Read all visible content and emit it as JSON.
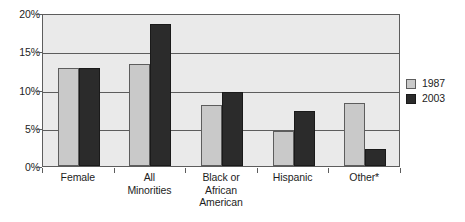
{
  "chart_data": {
    "type": "bar",
    "title": "",
    "subtitle": "",
    "xlabel": "",
    "ylabel": "",
    "categories": [
      "Female",
      "All Minorities",
      "Black or African American",
      "Hispanic",
      "Other*"
    ],
    "category_label_lines": [
      [
        "Female"
      ],
      [
        "All",
        "Minorities"
      ],
      [
        "Black or",
        "African",
        "American"
      ],
      [
        "Hispanic"
      ],
      [
        "Other*"
      ]
    ],
    "series": [
      {
        "name": "1987",
        "color": "#c9c9c9",
        "values": [
          12.8,
          13.3,
          8.0,
          4.6,
          8.3
        ]
      },
      {
        "name": "2003",
        "color": "#2b2b2b",
        "values": [
          12.8,
          18.5,
          9.7,
          7.2,
          2.2
        ]
      }
    ],
    "ylim": [
      0,
      20
    ],
    "ytick_values": [
      0,
      5,
      10,
      15,
      20
    ],
    "ytick_labels": [
      "0%",
      "5%",
      "10%",
      "15%",
      "20%"
    ],
    "grid": true,
    "grid_axis": "y",
    "legend_position": "right",
    "legend_entries": [
      "1987",
      "2003"
    ],
    "frame_background": "#eaeaea",
    "frame_border_color": "#5d5d5d",
    "page_background": "#ffffff"
  }
}
